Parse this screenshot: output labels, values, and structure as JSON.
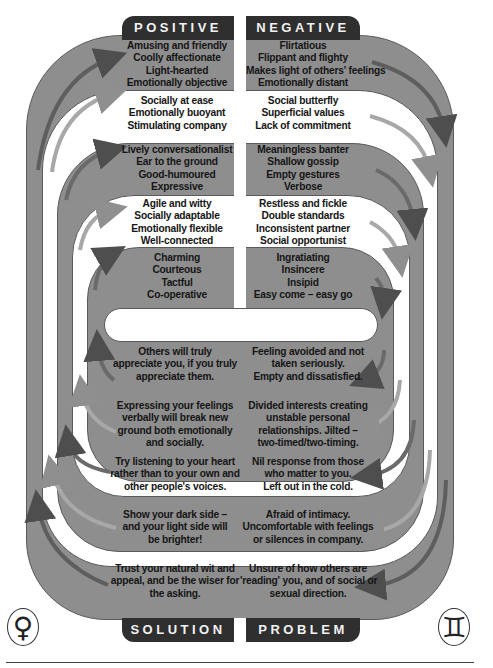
{
  "headers": {
    "top_left": "POSITIVE",
    "top_right": "NEGATIVE",
    "bottom_left": "SOLUTION",
    "bottom_right": "PROBLEM"
  },
  "symbols": {
    "left": {
      "name": "venus-symbol",
      "glyph": "♀"
    },
    "right": {
      "name": "gemini-symbol",
      "glyph": "♊"
    }
  },
  "colors": {
    "grey_band": "#8e8e8e",
    "white_band": "#ffffff",
    "tab": "#2f2f2f",
    "arrow_dark": "#555555",
    "arrow_light": "#9a9a9a"
  },
  "positive": [
    [
      "Amusing and friendly",
      "Coolly affectionate",
      "Light-hearted",
      "Emotionally objective"
    ],
    [
      "Socially at ease",
      "Emotionally buoyant",
      "Stimulating company"
    ],
    [
      "Lively conversationalist",
      "Ear to the ground",
      "Good-humoured",
      "Expressive"
    ],
    [
      "Agile and witty",
      "Socially adaptable",
      "Emotionally flexible",
      "Well-connected"
    ],
    [
      "Charming",
      "Courteous",
      "Tactful",
      "Co-operative"
    ]
  ],
  "negative": [
    [
      "Flirtatious",
      "Flippant and flighty",
      "Makes light of others' feelings",
      "Emotionally distant"
    ],
    [
      "Social butterfly",
      "Superficial values",
      "Lack of commitment"
    ],
    [
      "Meaningless banter",
      "Shallow gossip",
      "Empty gestures",
      "Verbose"
    ],
    [
      "Restless and fickle",
      "Double standards",
      "Inconsistent partner",
      "Social opportunist"
    ],
    [
      "Ingratiating",
      "Insincere",
      "Insipid",
      "Easy come – easy go"
    ]
  ],
  "solution": [
    [
      "Others will truly",
      "appreciate you, if you truly",
      "appreciate them."
    ],
    [
      "Expressing your feelings",
      "verbally will break new",
      "ground both emotionally",
      "and socially."
    ],
    [
      "Try listening to your heart",
      "rather than to your own and",
      "other people's voices."
    ],
    [
      "Show your dark side –",
      "and your light side will",
      "be brighter!"
    ],
    [
      "Trust your natural wit and",
      "appeal, and be the wiser for",
      "the asking."
    ]
  ],
  "problem": [
    [
      "Feeling avoided and not",
      "taken seriously.",
      "Empty and dissatisfied."
    ],
    [
      "Divided interests creating",
      "unstable personal",
      "relationships. Jilted –",
      "two-timed/two-timing."
    ],
    [
      "Nil response from those",
      "who matter to you.",
      "Left out in the cold."
    ],
    [
      "Afraid of intimacy.",
      "Uncomfortable with feelings",
      "or silences in company."
    ],
    [
      "Unsure of how others are",
      "'reading' you, and of social or",
      "sexual direction."
    ]
  ]
}
